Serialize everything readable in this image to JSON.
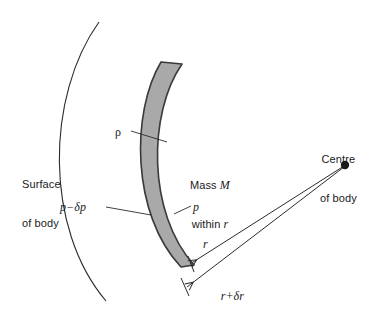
{
  "figure": {
    "background_color": "#ffffff",
    "width": 379,
    "height": 322
  },
  "colors": {
    "shell_fill": "#a9a9a9",
    "shell_stroke": "#3a3a3a",
    "line": "#2b2b2b",
    "text": "#1a1a1a"
  },
  "labels": {
    "surface_of_body_line1": "Surface",
    "surface_of_body_line2": "of body",
    "density": "ρ",
    "pressure_outer": "p−δp",
    "pressure_inner": "p",
    "mass_line1": "Mass M",
    "mass_line2": "within r",
    "mass_word": "Mass",
    "mass_symbol": "M",
    "within_word": "within",
    "within_symbol": "r",
    "centre_of_body_line1": "Centre",
    "centre_of_body_line2": "of body",
    "radius_inner": "r",
    "radius_outer": "r+δr",
    "radius_outer_symbol": "r",
    "radius_outer_delta": "+δr"
  },
  "geometry": {
    "centre_of_body": {
      "x": 345,
      "y": 165,
      "dot_radius": 4
    },
    "surface_arc": {
      "start_x": 99,
      "start_y": 22,
      "end_x": 106,
      "end_y": 301,
      "bulge_x": 47
    },
    "shell": {
      "outer_top_x": 161,
      "outer_top_y": 62,
      "outer_bottom_x": 181,
      "outer_bottom_y": 267,
      "inner_top_x": 182,
      "inner_top_y": 64,
      "inner_bottom_x": 194,
      "inner_bottom_y": 265,
      "thickness": 21
    },
    "radius_arrow_inner": {
      "from_x": 345,
      "from_y": 165,
      "to_x": 188,
      "to_y": 265
    },
    "radius_arrow_outer": {
      "from_x": 345,
      "from_y": 165,
      "to_x": 185,
      "to_y": 287
    },
    "leader_rho": {
      "from_x": 134,
      "from_y": 132,
      "to_x": 166,
      "to_y": 142
    },
    "leader_p_minus_dp": {
      "from_x": 107,
      "from_y": 207,
      "to_x": 150,
      "to_y": 214
    },
    "leader_p": {
      "from_x": 191,
      "from_y": 205,
      "to_x": 174,
      "to_y": 214
    }
  }
}
